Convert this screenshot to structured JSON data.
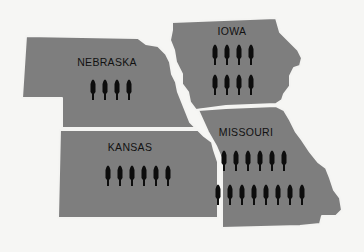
{
  "map": {
    "background_color": "#f6f6f4",
    "fill_color": "#7e7e7e",
    "border_color": "#f4f4f2",
    "icon_color": "#0d0d0d",
    "icon_type": "person-figure-icon",
    "states": [
      {
        "name": "NEBRASKA",
        "rows": [
          4
        ],
        "count": 4
      },
      {
        "name": "IOWA",
        "rows": [
          4,
          4
        ],
        "count": 8
      },
      {
        "name": "KANSAS",
        "rows": [
          6
        ],
        "count": 6
      },
      {
        "name": "MISSOURI",
        "rows": [
          6,
          7
        ],
        "count": 13
      }
    ]
  }
}
